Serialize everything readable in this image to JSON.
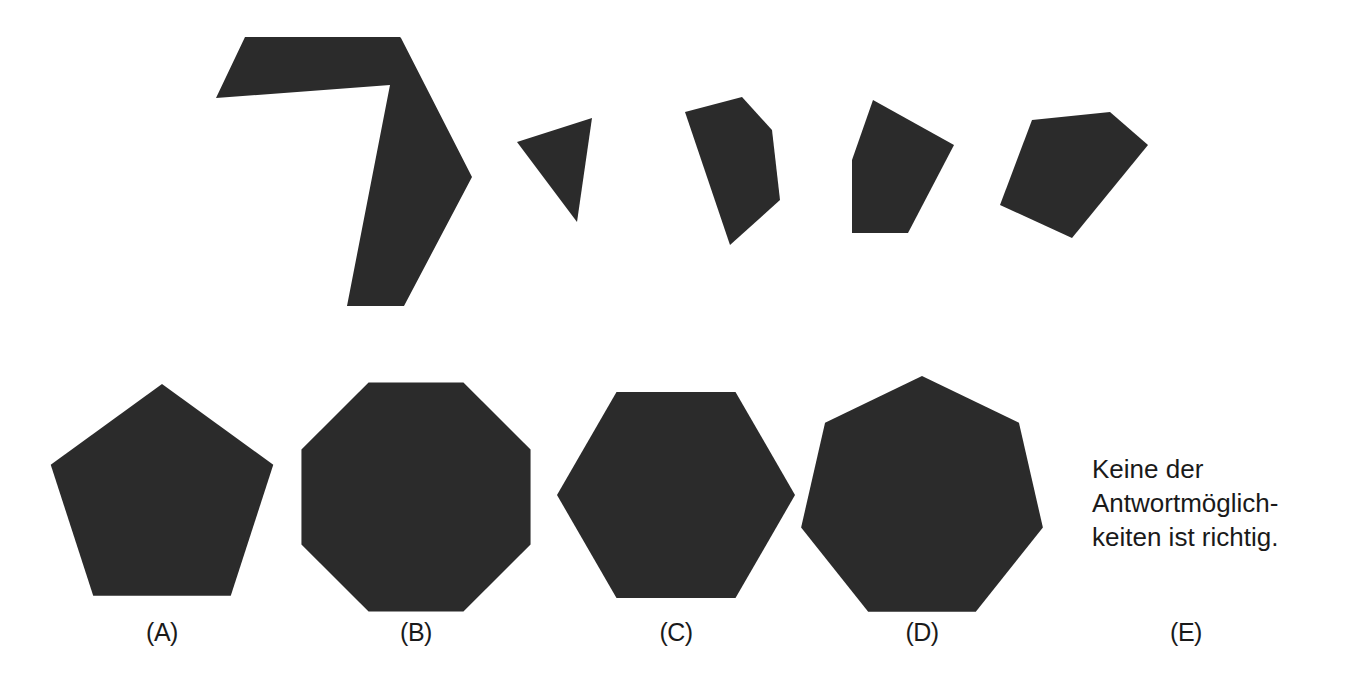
{
  "page": {
    "background_color": "#ffffff",
    "shape_fill_color": "#2b2b2b",
    "text_color": "#1a1a1a"
  },
  "prompt_figure": {
    "name": "puzzle-pieces-row",
    "pieces": [
      {
        "id": "piece-main-arrow",
        "description": "large concave arrow-like heptagon",
        "points": "245,37 400,37 401,38 472,177 404,306 347,306 390,85 216,98"
      },
      {
        "id": "piece-triangle",
        "description": "small triangle",
        "points": "592,118 517,142 577,222"
      },
      {
        "id": "piece-pentagon-tall",
        "description": "tall irregular pentagon",
        "points": "685,112 742,97 772,130 780,200 730,245"
      },
      {
        "id": "piece-quad-fan",
        "description": "fan shaped quadrilateral with flat bottom",
        "points": "873,100 954,145 908,233 852,233 852,160"
      },
      {
        "id": "piece-kite",
        "description": "wide kite shaped pentagon",
        "points": "1032,120 1110,112 1148,145 1072,238 1000,205"
      }
    ]
  },
  "answer_options": [
    {
      "key": "A",
      "label": "(A)",
      "shape": "regular-pentagon",
      "sides": 5,
      "center_x": 162,
      "center_y": 501,
      "radius": 117,
      "rotation_deg": -90,
      "label_x": 162,
      "label_y": 636
    },
    {
      "key": "B",
      "label": "(B)",
      "shape": "regular-octagon",
      "sides": 8,
      "center_x": 416,
      "center_y": 497,
      "radius": 124,
      "rotation_deg": -112.5,
      "label_x": 416,
      "label_y": 636
    },
    {
      "key": "C",
      "label": "(C)",
      "shape": "regular-hexagon",
      "sides": 6,
      "center_x": 676,
      "center_y": 495,
      "radius": 119,
      "rotation_deg": -120,
      "label_x": 676,
      "label_y": 636
    },
    {
      "key": "D",
      "label": "(D)",
      "shape": "regular-heptagon",
      "sides": 7,
      "center_x": 922,
      "center_y": 500,
      "radius": 124,
      "rotation_deg": -90,
      "label_x": 922,
      "label_y": 636
    },
    {
      "key": "E",
      "label": "(E)",
      "shape": "none-of-the-above-text",
      "sides": 0,
      "center_x": 1186,
      "center_y": 500,
      "radius": 0,
      "rotation_deg": 0,
      "label_x": 1186,
      "label_y": 636
    }
  ],
  "none_of_the_above": {
    "full_text": "Keine der Antwortmöglichkeiten ist richtig.",
    "lines": [
      "Keine der",
      "Antwortmöglich-",
      "keiten ist richtig."
    ]
  }
}
